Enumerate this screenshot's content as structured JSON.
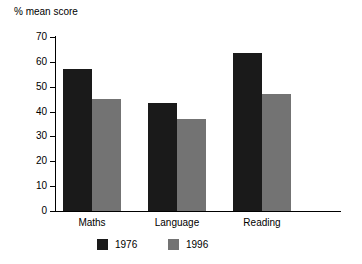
{
  "chart_data": {
    "type": "bar",
    "title": "",
    "subtitle": "",
    "xlabel": "",
    "ylabel": "% mean score",
    "categories": [
      "Maths",
      "Language",
      "Reading"
    ],
    "series": [
      {
        "name": "1976",
        "color": "#1a1a1a",
        "values": [
          57,
          43.5,
          63.5
        ]
      },
      {
        "name": "1996",
        "color": "#737373",
        "values": [
          45,
          37,
          47
        ]
      }
    ],
    "ylim": [
      0,
      70
    ],
    "ytick_step": 10,
    "yticks": [
      0,
      10,
      20,
      30,
      40,
      50,
      60,
      70
    ],
    "ytick_labels": [
      "0",
      "10",
      "20",
      "30",
      "40",
      "50",
      "60",
      "70"
    ],
    "grid": false,
    "legend_position": "bottom-center",
    "axis_color": "#000000",
    "background": "#ffffff"
  }
}
